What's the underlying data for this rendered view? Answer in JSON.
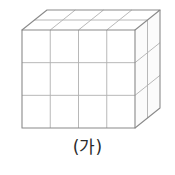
{
  "figure": {
    "name": "cuboid-unit-cubes",
    "caption": "(가)",
    "dimensions": {
      "width_cubes": 4,
      "height_cubes": 3,
      "depth_cubes": 2,
      "total_cubes": 24
    },
    "colors": {
      "background": "#ffffff",
      "outline": "#8a8a8a",
      "grid_line": "#b0b0b0",
      "top_face_fill": "#ffffff",
      "front_face_fill": "#ffffff",
      "right_face_fill": "#fbfbfb",
      "caption_text": "#2b2b2b"
    },
    "geometry": {
      "front_left_x": 22,
      "front_right_x": 135,
      "front_top_y": 30,
      "front_bottom_y": 128,
      "depth_dx": 25,
      "depth_dy": -20,
      "front_col_x": [
        22,
        50.25,
        78.5,
        106.75,
        135
      ],
      "front_row_y": [
        30,
        62.67,
        95.33,
        128
      ],
      "depth_steps": [
        0,
        0.5,
        1
      ]
    }
  }
}
